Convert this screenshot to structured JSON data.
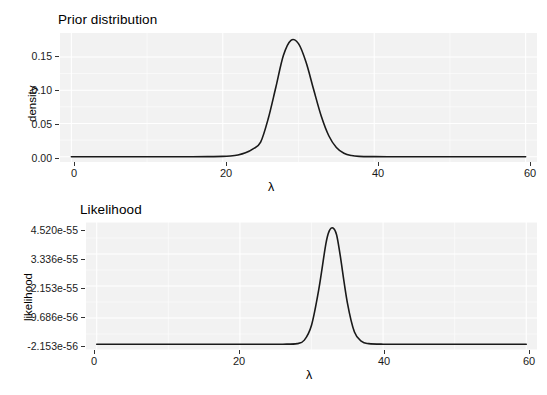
{
  "figure": {
    "background_color": "#ffffff",
    "panel_color": "#f2f2f2",
    "grid_color": "#ffffff",
    "line_color": "#1a1a1a"
  },
  "chart_data": [
    {
      "type": "line",
      "title": "Prior distribution",
      "xlabel": "λ",
      "ylabel": "density",
      "xlim": [
        -1.5,
        61.5
      ],
      "ylim": [
        -0.008,
        0.186
      ],
      "xticks": [
        0,
        20,
        40,
        60
      ],
      "xtick_labels": [
        "0",
        "20",
        "40",
        "60"
      ],
      "yticks": [
        0.0,
        0.05,
        0.1,
        0.15
      ],
      "ytick_labels": [
        "0.00",
        "0.05",
        "0.10",
        "0.15"
      ],
      "grid": true,
      "legend": "none",
      "distribution": "normal-like prior centred near lambda = 29",
      "peak_x": 29,
      "peak_y": 0.175,
      "x": [
        0,
        2,
        4,
        6,
        8,
        10,
        12,
        14,
        16,
        18,
        20,
        21,
        22,
        23,
        24,
        25,
        26,
        27,
        28,
        29,
        30,
        31,
        32,
        33,
        34,
        35,
        36,
        37,
        38,
        40,
        42,
        44,
        46,
        48,
        50,
        52,
        54,
        56,
        58,
        60
      ],
      "y": [
        0.0,
        0.0,
        0.0,
        0.0,
        0.0,
        0.0,
        0.0,
        0.0,
        0.0,
        0.0001,
        0.0004,
        0.0011,
        0.0026,
        0.0058,
        0.0118,
        0.0219,
        0.0571,
        0.104,
        0.152,
        0.175,
        0.17,
        0.142,
        0.101,
        0.0612,
        0.0315,
        0.0138,
        0.0052,
        0.0017,
        0.0005,
        0.0001,
        0.0,
        0.0,
        0.0,
        0.0,
        0.0,
        0.0,
        0.0,
        0.0,
        0.0,
        0.0
      ]
    },
    {
      "type": "line",
      "title": "Likelihood",
      "xlabel": "λ",
      "ylabel": "likelihood",
      "xlim": [
        -1.5,
        61.5
      ],
      "ylim": [
        -2.153e-56,
        4.52e-55
      ],
      "xticks": [
        0,
        20,
        40,
        60
      ],
      "xtick_labels": [
        "0",
        "20",
        "40",
        "60"
      ],
      "ytick_labels": [
        "-2.153e-56",
        "9.686e-56",
        "2.153e-55",
        "3.336e-55",
        "4.520e-55"
      ],
      "ytick_values": [
        -2.153e-56,
        9.686e-56,
        2.153e-55,
        3.336e-55,
        4.52e-55
      ],
      "grid": true,
      "legend": "none",
      "distribution": "sharp likelihood peak near lambda = 33",
      "peak_x": 33,
      "peak_y": 4.3e-55,
      "x": [
        0,
        4,
        8,
        12,
        16,
        20,
        24,
        26,
        28,
        29,
        30,
        31,
        32,
        32.5,
        33,
        33.5,
        34,
        35,
        36,
        37,
        38,
        40,
        44,
        48,
        52,
        56,
        60
      ],
      "y": [
        0.0,
        0.0,
        0.0,
        0.0,
        0.0,
        0.0,
        0.0,
        0.0,
        2e-57,
        1.5e-56,
        7e-56,
        2e-55,
        3.7e-55,
        4.2e-55,
        4.3e-55,
        4.05e-55,
        3.3e-55,
        1.55e-55,
        4.5e-56,
        1e-56,
        2e-57,
        0.0,
        0.0,
        0.0,
        0.0,
        0.0,
        0.0
      ]
    }
  ]
}
